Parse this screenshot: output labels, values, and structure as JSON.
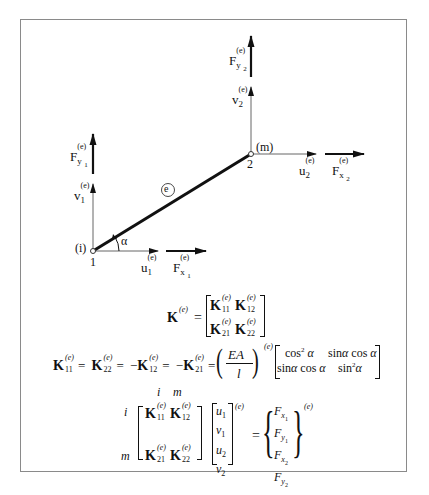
{
  "diagram": {
    "type": "truss-bar-element",
    "element_label": "e",
    "angle_label": "α",
    "nodes": [
      {
        "id": "1",
        "local": "(i)",
        "x": 93,
        "y": 251
      },
      {
        "id": "2",
        "local": "(m)",
        "x": 251,
        "y": 154
      }
    ],
    "labels": {
      "node1_number": "1",
      "node1_local": "(i)",
      "node2_number": "2",
      "node2_local": "(m)",
      "element": "e",
      "angle": "α",
      "u1": "u",
      "u1_sub": "1",
      "v1": "v",
      "v1_sub": "1",
      "u2": "u",
      "u2_sub": "2",
      "v2": "v",
      "v2_sub": "2",
      "Fx1": "F",
      "Fx1_sub": "x",
      "Fx1_subsub": "1",
      "Fy1": "F",
      "Fy1_sub": "y",
      "Fy1_subsub": "1",
      "Fx2": "F",
      "Fx2_sub": "x",
      "Fx2_subsub": "2",
      "Fy2": "F",
      "Fy2_sub": "y",
      "Fy2_subsub": "2",
      "sup_e": "(e)"
    }
  },
  "equations": {
    "stiffness_matrix": {
      "lhs": "K",
      "sup": "(e)",
      "eq": "=",
      "entries": [
        [
          "K",
          "11"
        ],
        [
          "K",
          "12"
        ],
        [
          "K",
          "21"
        ],
        [
          "K",
          "22"
        ]
      ]
    },
    "submatrix_relation": {
      "terms": [
        "K₁₁⁽ᵉ⁾",
        "=",
        "K₂₂⁽ᵉ⁾",
        "=",
        "−K₁₂⁽ᵉ⁾",
        "=",
        "−K₂₁⁽ᵉ⁾",
        "="
      ],
      "factor_num": "EA",
      "factor_den": "l",
      "factor_sup": "(e)",
      "matrix": [
        [
          "cos² α",
          "sinα cos α"
        ],
        [
          "sinα cos α",
          "sin² α"
        ]
      ]
    },
    "system": {
      "col_labels": [
        "i",
        "m"
      ],
      "row_labels": [
        "i",
        "m"
      ],
      "K_entries": [
        [
          "11",
          "12"
        ],
        [
          "21",
          "22"
        ]
      ],
      "disp_vector": [
        "u1",
        "v1",
        "u2",
        "v2"
      ],
      "disp_sup": "(e)",
      "eq": "=",
      "force_vector": [
        "F_x1",
        "F_y1",
        "F_x2",
        "F_y2"
      ],
      "force_sup": "(e)"
    }
  },
  "text": {
    "K": "K",
    "e_sup": "(e)",
    "eq": "=",
    "minus": "−",
    "EA": "EA",
    "l": "l",
    "cos2a": "cos",
    "sina": "sin",
    "alpha": "α",
    "two": "2",
    "i": "i",
    "m": "m",
    "u": "u",
    "v": "v",
    "F": "F",
    "x": "x",
    "y": "y",
    "one": "1",
    "s11": "11",
    "s12": "12",
    "s21": "21",
    "s22": "22"
  }
}
